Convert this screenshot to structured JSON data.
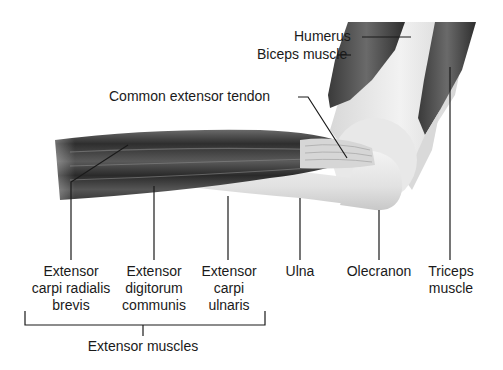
{
  "diagram": {
    "colors": {
      "background": "#ffffff",
      "leader_line": "#1a1a1a",
      "muscle_dark": "#3a3a3a",
      "bone_light": "#e6e6e6"
    },
    "top_labels": {
      "humerus": "Humerus",
      "biceps": "Biceps muscle",
      "common_tendon": "Common extensor tendon"
    },
    "bottom_labels": {
      "ecrb": [
        "Extensor",
        "carpi radialis",
        "brevis"
      ],
      "edc": [
        "Extensor",
        "digitorum",
        "communis"
      ],
      "ecu": [
        "Extensor",
        "carpi",
        "ulnaris"
      ],
      "ulna": "Ulna",
      "olecranon": "Olecranon",
      "triceps": [
        "Triceps",
        "muscle"
      ]
    },
    "group_label": "Extensor muscles"
  }
}
